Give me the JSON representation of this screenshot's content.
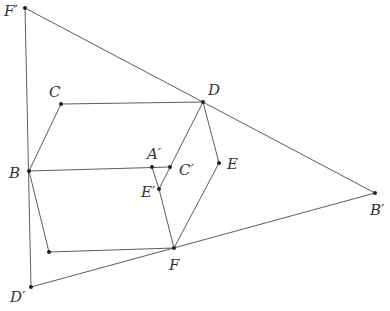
{
  "diagram": {
    "type": "geometry-figure",
    "points": {
      "Fp": {
        "label": "F′",
        "x": 25,
        "y": 8,
        "lx": 4,
        "ly": 16
      },
      "C": {
        "label": "C",
        "x": 61,
        "y": 104,
        "lx": 49,
        "ly": 97
      },
      "D": {
        "label": "D",
        "x": 203,
        "y": 102,
        "lx": 208,
        "ly": 95
      },
      "B": {
        "label": "B",
        "x": 29,
        "y": 171,
        "lx": 9,
        "ly": 178
      },
      "Ap": {
        "label": "A′",
        "x": 152,
        "y": 167,
        "lx": 147,
        "ly": 159
      },
      "Cp": {
        "label": "C′",
        "x": 170,
        "y": 167,
        "lx": 179,
        "ly": 175
      },
      "E": {
        "label": "E",
        "x": 219,
        "y": 163,
        "lx": 227,
        "ly": 169
      },
      "Ep": {
        "label": "E′",
        "x": 159,
        "y": 189,
        "lx": 141,
        "ly": 197
      },
      "G": {
        "label": "",
        "x": 49,
        "y": 252,
        "lx": 0,
        "ly": 0
      },
      "F": {
        "label": "F",
        "x": 174,
        "y": 248,
        "lx": 169,
        "ly": 270
      },
      "Dp": {
        "label": "D′",
        "x": 31,
        "y": 287,
        "lx": 10,
        "ly": 302
      },
      "Bp": {
        "label": "B′",
        "x": 375,
        "y": 193,
        "lx": 370,
        "ly": 215
      }
    },
    "segments": [
      [
        "Fp",
        "Bp"
      ],
      [
        "Fp",
        "Dp"
      ],
      [
        "Dp",
        "Bp"
      ],
      [
        "B",
        "C"
      ],
      [
        "C",
        "D"
      ],
      [
        "B",
        "Cp"
      ],
      [
        "D",
        "Ep"
      ],
      [
        "D",
        "E"
      ],
      [
        "E",
        "F"
      ],
      [
        "B",
        "G"
      ],
      [
        "G",
        "F"
      ],
      [
        "Ap",
        "Ep"
      ],
      [
        "Ep",
        "F"
      ]
    ],
    "colors": {
      "line": "#4a4a4a",
      "point": "#222222",
      "label": "#333333"
    }
  }
}
